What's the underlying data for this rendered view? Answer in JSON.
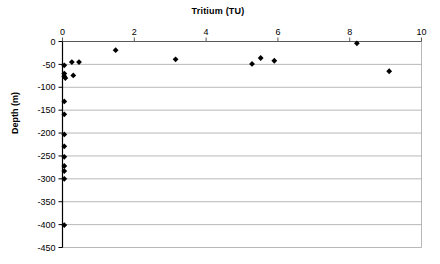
{
  "chart_data": {
    "type": "scatter",
    "title": "Tritium (TU)",
    "xlabel": "Tritium (TU)",
    "ylabel": "Depth (m)",
    "xlim": [
      0,
      10
    ],
    "ylim": [
      -450,
      0
    ],
    "xticks": [
      "0",
      "2",
      "4",
      "6",
      "8",
      "10"
    ],
    "xtick_values": [
      0,
      2,
      4,
      6,
      8,
      10
    ],
    "yticks": [
      "0",
      "-50",
      "-100",
      "-150",
      "-200",
      "-250",
      "-300",
      "-350",
      "-400",
      "-450"
    ],
    "ytick_values": [
      0,
      -50,
      -100,
      -150,
      -200,
      -250,
      -300,
      -350,
      -400,
      -450
    ],
    "grid": "horizontal",
    "legend": "none",
    "marker": "diamond",
    "marker_color": "#000000",
    "series": [
      {
        "name": "Tritium vs Depth",
        "points": [
          {
            "x": 0.05,
            "y": -52
          },
          {
            "x": 0.05,
            "y": -70
          },
          {
            "x": 0.05,
            "y": -76
          },
          {
            "x": 0.08,
            "y": -80
          },
          {
            "x": 0.05,
            "y": -131
          },
          {
            "x": 0.05,
            "y": -159
          },
          {
            "x": 0.05,
            "y": -203
          },
          {
            "x": 0.05,
            "y": -229
          },
          {
            "x": 0.05,
            "y": -252
          },
          {
            "x": 0.05,
            "y": -272
          },
          {
            "x": 0.05,
            "y": -283
          },
          {
            "x": 0.05,
            "y": -300
          },
          {
            "x": 0.05,
            "y": -401
          },
          {
            "x": 0.26,
            "y": -45
          },
          {
            "x": 0.46,
            "y": -45
          },
          {
            "x": 0.3,
            "y": -74
          },
          {
            "x": 1.48,
            "y": -19
          },
          {
            "x": 3.15,
            "y": -39
          },
          {
            "x": 5.28,
            "y": -49
          },
          {
            "x": 5.52,
            "y": -36
          },
          {
            "x": 5.9,
            "y": -42
          },
          {
            "x": 8.2,
            "y": -4
          },
          {
            "x": 9.1,
            "y": -65
          }
        ]
      }
    ],
    "colors": {
      "axis": "#000000",
      "grid": "#9a9a9a",
      "marker": "#000000",
      "background": "#ffffff"
    }
  }
}
